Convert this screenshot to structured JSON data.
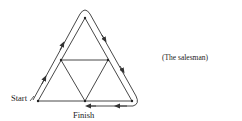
{
  "diagram": {
    "labels": {
      "start": "Start",
      "finish": "Finish",
      "caption": "(The salesman)"
    },
    "colors": {
      "line": "#333333",
      "background": "#ffffff"
    },
    "nodes": [
      {
        "id": "top",
        "x": 85,
        "y": 18
      },
      {
        "id": "mid-left",
        "x": 61,
        "y": 60
      },
      {
        "id": "mid-right",
        "x": 108,
        "y": 60
      },
      {
        "id": "bottom-left",
        "x": 38,
        "y": 101
      },
      {
        "id": "bottom-mid",
        "x": 85,
        "y": 101
      },
      {
        "id": "bottom-right",
        "x": 132,
        "y": 101
      }
    ],
    "path_description": "Salesman route from Start along outside of left edge, around apex, down right edge, around bottom-right corner, then left to Finish"
  }
}
